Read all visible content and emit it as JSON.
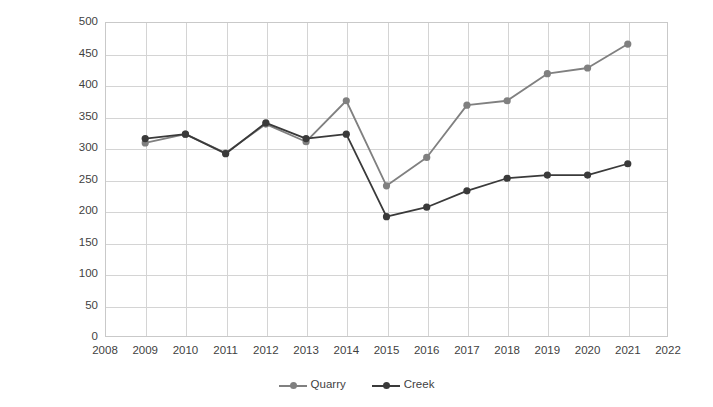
{
  "chart_data": {
    "type": "line",
    "title": "",
    "xlabel": "",
    "ylabel": "Number of penguins",
    "x": [
      2009,
      2010,
      2011,
      2012,
      2013,
      2014,
      2015,
      2016,
      2017,
      2018,
      2019,
      2020,
      2021
    ],
    "xlim": [
      2008,
      2022
    ],
    "ylim": [
      0,
      500
    ],
    "xticks": [
      "2008",
      "2009",
      "2010",
      "2011",
      "2012",
      "2013",
      "2014",
      "2015",
      "2016",
      "2017",
      "2018",
      "2019",
      "2020",
      "2021",
      "2022"
    ],
    "yticks": [
      "0",
      "50",
      "100",
      "150",
      "200",
      "250",
      "300",
      "350",
      "400",
      "450",
      "500"
    ],
    "grid": true,
    "legend_position": "bottom",
    "series": [
      {
        "name": "Quarry",
        "color": "#808080",
        "marker": "circle",
        "values": [
          308,
          322,
          292,
          338,
          310,
          375,
          240,
          285,
          368,
          375,
          418,
          427,
          465
        ]
      },
      {
        "name": "Creek",
        "color": "#3a3a3a",
        "marker": "circle",
        "values": [
          315,
          322,
          291,
          340,
          315,
          322,
          191,
          206,
          232,
          252,
          257,
          257,
          275
        ]
      }
    ]
  },
  "legend": {
    "items": [
      {
        "label": "Quarry",
        "color": "#808080"
      },
      {
        "label": "Creek",
        "color": "#3a3a3a"
      }
    ]
  },
  "axes": {
    "y_title": "Number of penguins"
  }
}
